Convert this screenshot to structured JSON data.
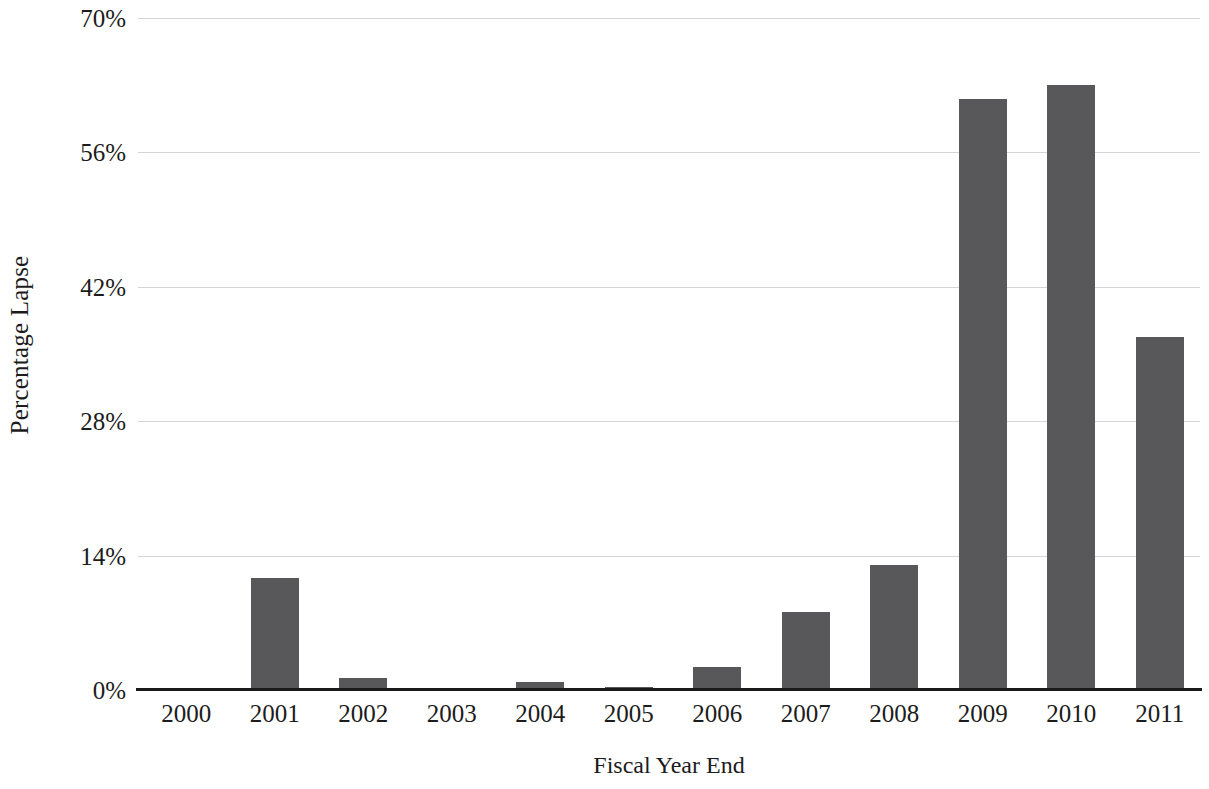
{
  "chart_data": {
    "type": "bar",
    "title": "",
    "xlabel": "Fiscal Year End",
    "ylabel": "Percentage Lapse",
    "categories": [
      "2000",
      "2001",
      "2002",
      "2003",
      "2004",
      "2005",
      "2006",
      "2007",
      "2008",
      "2009",
      "2010",
      "2011"
    ],
    "values": [
      0,
      11.7,
      1.3,
      0,
      0.8,
      0.3,
      2.4,
      8.1,
      13.0,
      61.6,
      63.0,
      36.8
    ],
    "ylim": [
      0,
      70
    ],
    "yticks": [
      0,
      14,
      28,
      42,
      56,
      70
    ],
    "ytick_labels": [
      "0%",
      "14%",
      "28%",
      "42%",
      "56%",
      "70%"
    ],
    "grid": true,
    "legend": "none",
    "bar_color": "#58585a",
    "gridline_color": "#d4d4d4",
    "axis_color": "#1a1a1a"
  }
}
